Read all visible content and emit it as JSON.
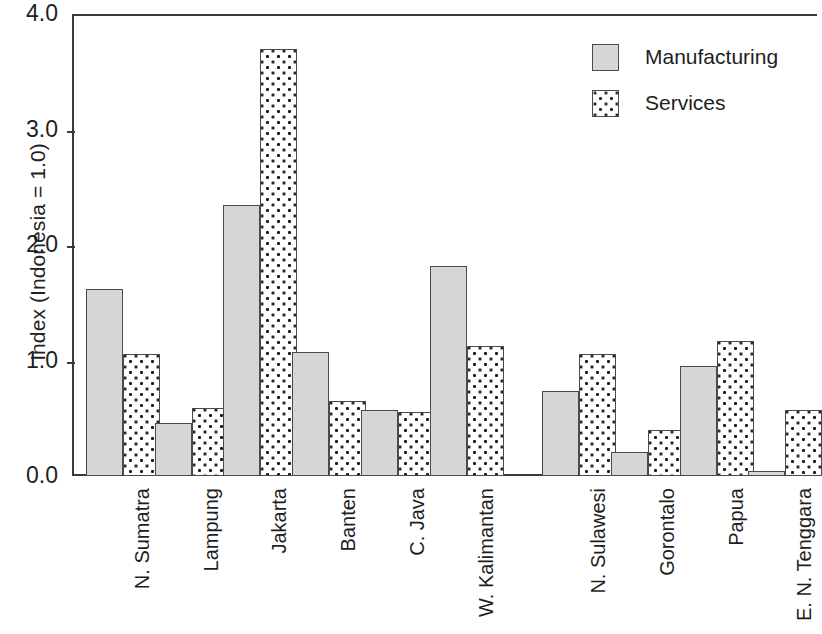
{
  "chart_data": {
    "type": "bar",
    "title": "",
    "xlabel": "",
    "ylabel": "Index (Indonesia = 1.0)",
    "ylim": [
      0.0,
      4.0
    ],
    "yticks": [
      "0.0",
      "1.0",
      "2.0",
      "3.0",
      "4.0"
    ],
    "ytick_values": [
      0.0,
      1.0,
      2.0,
      3.0,
      4.0
    ],
    "grid": false,
    "legend_position": "top-right",
    "categories": [
      "N. Sumatra",
      "Lampung",
      "Jakarta",
      "Banten",
      "C. Java",
      "W. Kalimantan",
      "N. Sulawesi",
      "Gorontalo",
      "Papua",
      "E. N. Tenggara"
    ],
    "group_break_after_index": 5,
    "series": [
      {
        "name": "Manufacturing",
        "fill": "solid-gray",
        "color": "#d6d6d6",
        "values": [
          1.62,
          0.46,
          2.35,
          1.07,
          0.57,
          1.82,
          0.74,
          0.21,
          0.95,
          0.04
        ]
      },
      {
        "name": "Services",
        "fill": "dotted",
        "color": "#ffffff",
        "values": [
          1.06,
          0.59,
          3.7,
          0.65,
          0.55,
          1.13,
          1.06,
          0.4,
          1.17,
          0.57
        ]
      }
    ]
  },
  "legend": {
    "items": [
      {
        "label": "Manufacturing",
        "pattern": "solid-gray"
      },
      {
        "label": "Services",
        "pattern": "dotted"
      }
    ]
  }
}
